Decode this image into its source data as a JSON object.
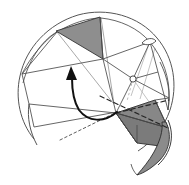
{
  "figure": {
    "title": "Spherical polyhedron folding diagram",
    "kind": "geometric-line-diagram",
    "canvas": {
      "width": 189,
      "height": 185
    },
    "background_color": "#ffffff",
    "palette": {
      "outline": "#4a4a4a",
      "shaded_facet": "#8e8e8e",
      "shaded_facet_dark": "#7b7b7b",
      "dashed_fold": "#262626",
      "rotation_arrow": "#111111",
      "pale_edge": "#9a9a9a",
      "node_fill": "#ffffff"
    },
    "elements": {
      "boundary_arc_label": "sphere-boundary-arc",
      "shaded_facet_top_label": "upper-shaded-facet",
      "shaded_facet_bottom_label": "lower-shaded-facet",
      "rotation_arrow_label": "rotation-arrow",
      "dashed_fold_label": "dashed-fold-axis",
      "crescent_label": "curved-flap",
      "node_label": "vertex-node",
      "lens_label": "lens-marker"
    },
    "geometry": {
      "circle_center": [
        94,
        90
      ],
      "circle_radius": 78,
      "upper_facet_vertices": [
        [
          56,
          31
        ],
        [
          100,
          17
        ],
        [
          103,
          59
        ]
      ],
      "lower_facet_vertices": [
        [
          116,
          113
        ],
        [
          155,
          100
        ],
        [
          164,
          141
        ],
        [
          137,
          143
        ]
      ],
      "rotation_arrow_start": [
        117,
        112
      ],
      "rotation_arrow_end": [
        72,
        72
      ],
      "dashed_fold_start": [
        60,
        140
      ],
      "dashed_fold_end": [
        170,
        88
      ],
      "vertex_node": [
        133,
        78
      ],
      "lens_marker": [
        148,
        40
      ]
    }
  }
}
